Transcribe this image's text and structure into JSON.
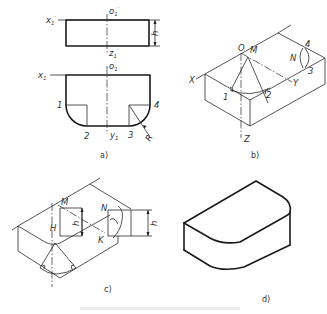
{
  "figure": {
    "panels": [
      {
        "id": "a",
        "caption": "a)",
        "labels": {
          "x1_prime": "x",
          "o1_prime": "o",
          "z1_prime": "z",
          "x1": "x",
          "o1": "o",
          "y1": "y",
          "sub1": "1",
          "prime": "′",
          "p1": "1",
          "p2": "2",
          "p3": "3",
          "p4": "4",
          "R": "R",
          "h": "h"
        }
      },
      {
        "id": "b",
        "caption": "b)",
        "labels": {
          "O": "O",
          "M": "M",
          "N": "N",
          "X": "X",
          "Y": "Y",
          "Z": "Z",
          "p1": "1",
          "p2": "2",
          "p3": "3",
          "p4": "4"
        }
      },
      {
        "id": "c",
        "caption": "c)",
        "labels": {
          "M": "M",
          "H": "H",
          "N": "N",
          "K": "K",
          "h_left": "h",
          "h_right": "h"
        }
      },
      {
        "id": "d",
        "caption": "d)"
      }
    ],
    "colors": {
      "line": "#1a1a1a",
      "text": "#333333",
      "background": "#ffffff"
    }
  }
}
